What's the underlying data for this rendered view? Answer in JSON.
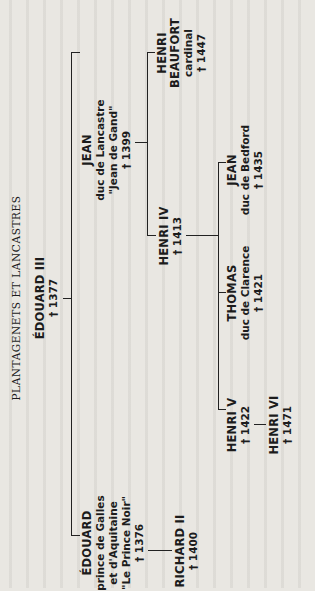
{
  "title": "PLANTAGENETS ET LANCASTRES",
  "nodes": {
    "edouard3": {
      "name": "ÉDOUARD III",
      "death": "† 1377"
    },
    "jean_gand": {
      "name": "JEAN",
      "line1": "duc de Lancastre",
      "line2": "\"Jean de Gand\"",
      "death": "† 1399"
    },
    "beaufort": {
      "name1": "HENRI",
      "name2": "BEAUFORT",
      "line1": "cardinal",
      "death": "† 1447"
    },
    "henri4": {
      "name": "HENRI IV",
      "death": "† 1413"
    },
    "jean_bedford": {
      "name": "JEAN",
      "line1": "duc de Bedford",
      "death": "† 1435"
    },
    "thomas": {
      "name": "THOMAS",
      "line1": "duc de Clarence",
      "death": "† 1421"
    },
    "henri5": {
      "name": "HENRI V",
      "death": "† 1422"
    },
    "henri6": {
      "name": "HENRI VI",
      "death": "† 1471"
    },
    "prince_noir": {
      "name": "ÉDOUARD",
      "line1": "prince de Galles",
      "line2": "et d'Aquitaine",
      "line3": "\"Le Prince Noir\"",
      "death": "† 1376"
    },
    "richard2": {
      "name": "RICHARD II",
      "death": "† 1400"
    }
  }
}
